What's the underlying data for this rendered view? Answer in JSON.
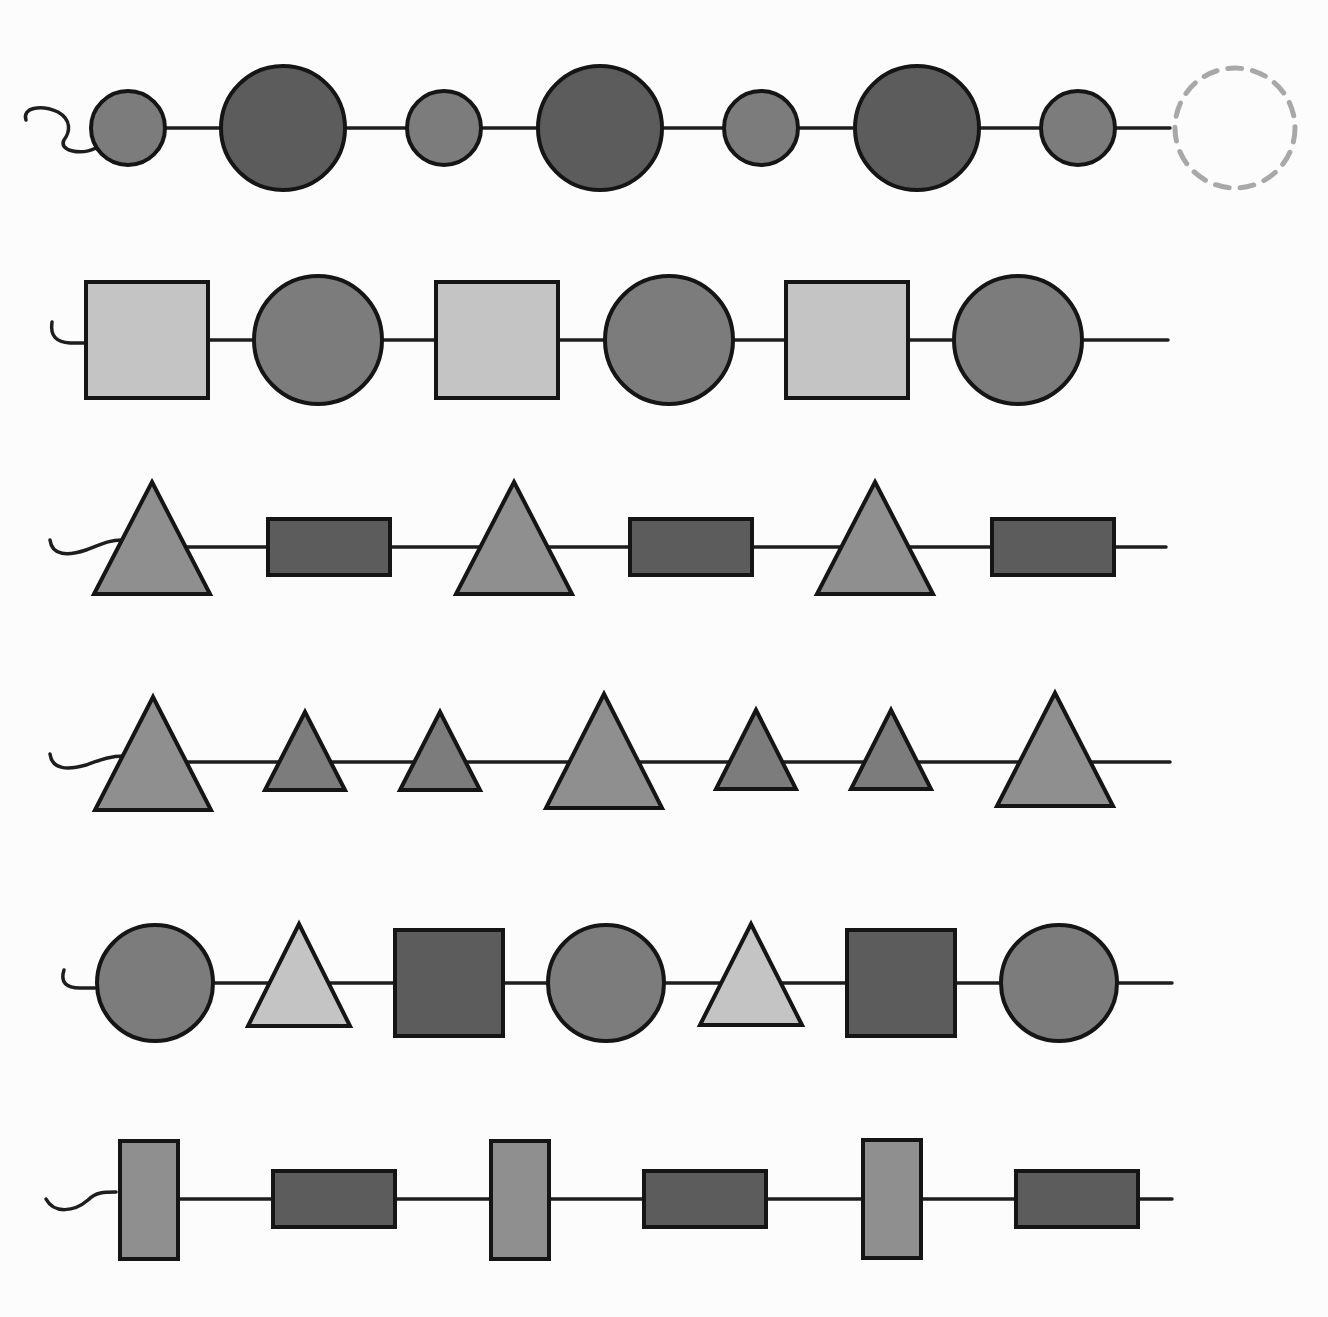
{
  "puzzle": {
    "type": "bead-string-pattern",
    "colors": {
      "string": "#1e1e1e",
      "outline": "#151515",
      "dark": "#5c5c5c",
      "medium": "#7c7c7c",
      "mediumlight": "#8f8f8f",
      "light": "#c4c4c4",
      "missing": "#a8a8a8"
    },
    "rows": [
      {
        "id": "row-1",
        "y": 128,
        "string_end_x": 1170,
        "tail": "M26,120 C22,108 40,104 58,112 C72,120 70,132 64,140 C58,150 80,156 96,148",
        "beads": [
          {
            "shape": "circle",
            "cx": 128,
            "r": 37,
            "fill": "medium"
          },
          {
            "shape": "circle",
            "cx": 283,
            "r": 62,
            "fill": "dark"
          },
          {
            "shape": "circle",
            "cx": 444,
            "r": 37,
            "fill": "medium"
          },
          {
            "shape": "circle",
            "cx": 600,
            "r": 62,
            "fill": "dark"
          },
          {
            "shape": "circle",
            "cx": 761,
            "r": 37,
            "fill": "medium"
          },
          {
            "shape": "circle",
            "cx": 917,
            "r": 62,
            "fill": "dark"
          },
          {
            "shape": "circle",
            "cx": 1078,
            "r": 37,
            "fill": "medium"
          }
        ],
        "missing": {
          "shape": "circle",
          "cx": 1235,
          "r": 60,
          "label": "missing-bead"
        }
      },
      {
        "id": "row-2",
        "y": 340,
        "string_end_x": 1168,
        "tail": "M52,322 C50,336 56,342 70,343 L85,343",
        "beads": [
          {
            "shape": "rect",
            "cx": 147,
            "w": 122,
            "h": 116,
            "fill": "light"
          },
          {
            "shape": "circle",
            "cx": 318,
            "r": 64,
            "fill": "medium"
          },
          {
            "shape": "rect",
            "cx": 497,
            "w": 122,
            "h": 116,
            "fill": "light"
          },
          {
            "shape": "circle",
            "cx": 669,
            "r": 64,
            "fill": "medium"
          },
          {
            "shape": "rect",
            "cx": 847,
            "w": 122,
            "h": 116,
            "fill": "light"
          },
          {
            "shape": "circle",
            "cx": 1018,
            "r": 64,
            "fill": "medium"
          }
        ]
      },
      {
        "id": "row-3",
        "y": 547,
        "string_end_x": 1166,
        "tail": "M50,540 C52,556 68,556 86,550 C100,545 108,540 122,540",
        "beads": [
          {
            "shape": "triangle",
            "cx": 152,
            "top": 482,
            "base": 594,
            "half": 58,
            "fill": "mediumlight"
          },
          {
            "shape": "rect",
            "cx": 329,
            "w": 122,
            "h": 56,
            "fill": "dark"
          },
          {
            "shape": "triangle",
            "cx": 514,
            "top": 482,
            "base": 594,
            "half": 58,
            "fill": "mediumlight"
          },
          {
            "shape": "rect",
            "cx": 691,
            "w": 122,
            "h": 56,
            "fill": "dark"
          },
          {
            "shape": "triangle",
            "cx": 875,
            "top": 482,
            "base": 594,
            "half": 58,
            "fill": "mediumlight"
          },
          {
            "shape": "rect",
            "cx": 1053,
            "w": 122,
            "h": 56,
            "fill": "dark"
          }
        ]
      },
      {
        "id": "row-4",
        "y": 762,
        "string_end_x": 1170,
        "tail": "M50,754 C52,770 68,770 86,765 C100,760 110,756 124,756",
        "beads": [
          {
            "shape": "triangle",
            "cx": 153,
            "top": 697,
            "base": 810,
            "half": 58,
            "fill": "mediumlight"
          },
          {
            "shape": "triangle",
            "cx": 305,
            "top": 712,
            "base": 790,
            "half": 40,
            "fill": "medium"
          },
          {
            "shape": "triangle",
            "cx": 440,
            "top": 712,
            "base": 790,
            "half": 40,
            "fill": "medium"
          },
          {
            "shape": "triangle",
            "cx": 604,
            "top": 694,
            "base": 808,
            "half": 58,
            "fill": "mediumlight"
          },
          {
            "shape": "triangle",
            "cx": 756,
            "top": 710,
            "base": 789,
            "half": 40,
            "fill": "medium"
          },
          {
            "shape": "triangle",
            "cx": 891,
            "top": 710,
            "base": 789,
            "half": 40,
            "fill": "medium"
          },
          {
            "shape": "triangle",
            "cx": 1055,
            "top": 693,
            "base": 806,
            "half": 58,
            "fill": "mediumlight"
          }
        ]
      },
      {
        "id": "row-5",
        "y": 983,
        "string_end_x": 1172,
        "tail": "M64,970 C60,982 66,988 80,988 L95,988",
        "beads": [
          {
            "shape": "circle",
            "cx": 155,
            "r": 58,
            "fill": "medium"
          },
          {
            "shape": "triangle",
            "cx": 299,
            "top": 924,
            "base": 1026,
            "half": 51,
            "fill": "light"
          },
          {
            "shape": "rect",
            "cx": 449,
            "w": 108,
            "h": 106,
            "fill": "dark"
          },
          {
            "shape": "circle",
            "cx": 606,
            "r": 58,
            "fill": "medium"
          },
          {
            "shape": "triangle",
            "cx": 751,
            "top": 924,
            "base": 1025,
            "half": 51,
            "fill": "light"
          },
          {
            "shape": "rect",
            "cx": 901,
            "w": 108,
            "h": 106,
            "fill": "dark"
          },
          {
            "shape": "circle",
            "cx": 1059,
            "r": 58,
            "fill": "medium"
          }
        ]
      },
      {
        "id": "row-6",
        "y": 1199,
        "string_end_x": 1172,
        "tail": "M46,1199 C54,1214 74,1212 88,1200 C96,1192 104,1192 116,1192",
        "beads": [
          {
            "shape": "rect",
            "cx": 149,
            "cy": 1200,
            "w": 58,
            "h": 118,
            "fill": "mediumlight"
          },
          {
            "shape": "rect",
            "cx": 334,
            "w": 122,
            "h": 56,
            "fill": "dark"
          },
          {
            "shape": "rect",
            "cx": 520,
            "cy": 1200,
            "w": 58,
            "h": 118,
            "fill": "mediumlight"
          },
          {
            "shape": "rect",
            "cx": 705,
            "w": 122,
            "h": 56,
            "fill": "dark"
          },
          {
            "shape": "rect",
            "cx": 892,
            "cy": 1199,
            "w": 58,
            "h": 118,
            "fill": "mediumlight"
          },
          {
            "shape": "rect",
            "cx": 1077,
            "w": 122,
            "h": 56,
            "fill": "dark"
          }
        ]
      }
    ]
  }
}
